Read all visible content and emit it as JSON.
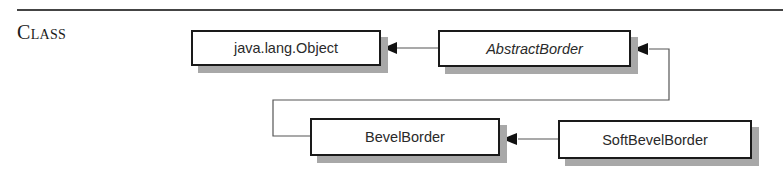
{
  "section": {
    "label": "Class"
  },
  "diagram": {
    "type": "class-hierarchy",
    "classes": [
      {
        "id": "object",
        "name": "java.lang.Object",
        "abstract": false
      },
      {
        "id": "abstract-border",
        "name": "AbstractBorder",
        "abstract": true
      },
      {
        "id": "bevel-border",
        "name": "BevelBorder",
        "abstract": false
      },
      {
        "id": "soft-bevel-border",
        "name": "SoftBevelBorder",
        "abstract": false
      }
    ],
    "edges": [
      {
        "from": "abstract-border",
        "to": "object",
        "kind": "extends"
      },
      {
        "from": "bevel-border",
        "to": "abstract-border",
        "kind": "extends"
      },
      {
        "from": "soft-bevel-border",
        "to": "bevel-border",
        "kind": "extends"
      }
    ],
    "colors": {
      "border": "#1a1a1a",
      "shadow": "#a8a8a8",
      "connector": "#555555",
      "text": "#2a2a2a"
    }
  }
}
